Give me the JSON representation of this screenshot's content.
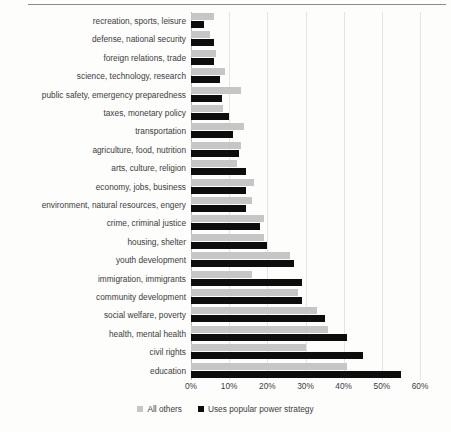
{
  "chart_data": {
    "type": "bar",
    "orientation": "horizontal",
    "title": "",
    "xlabel": "",
    "ylabel": "",
    "xlim": [
      0,
      60
    ],
    "xunit": "%",
    "grid": true,
    "legend_position": "bottom",
    "xticks": [
      "0%",
      "10%",
      "20%",
      "30%",
      "40%",
      "50%",
      "60%"
    ],
    "xtick_values": [
      0,
      10,
      20,
      30,
      40,
      50,
      60
    ],
    "categories": [
      "recreation, sports, leisure",
      "defense, national security",
      "foreign relations, trade",
      "science, technology, research",
      "public safety, emergency preparedness",
      "taxes, monetary policy",
      "transportation",
      "agriculture, food, nutrition",
      "arts, culture, religion",
      "economy, jobs, business",
      "environment, natural resources, engery",
      "crime, criminal justice",
      "housing, shelter",
      "youth development",
      "immigration, immigrants",
      "community development",
      "social welfare, poverty",
      "health, mental health",
      "civil rights",
      "education"
    ],
    "series": [
      {
        "name": "All others",
        "color": "#c6c6c6",
        "values": [
          6,
          5,
          6.5,
          9,
          13,
          8.5,
          14,
          13,
          12,
          16.5,
          16,
          19,
          19,
          26,
          16,
          28,
          33,
          36,
          30,
          41
        ]
      },
      {
        "name": "Uses popular power strategy",
        "color": "#0d0d0d",
        "values": [
          3.5,
          6,
          6,
          7.5,
          8,
          10,
          11,
          12.5,
          14.5,
          14.5,
          14.5,
          18,
          20,
          27,
          29,
          29,
          35,
          41,
          45,
          55
        ]
      }
    ]
  },
  "legend": {
    "items": [
      {
        "label": "All others",
        "swatch": "others"
      },
      {
        "label": "Uses popular power strategy",
        "swatch": "popular"
      }
    ]
  }
}
